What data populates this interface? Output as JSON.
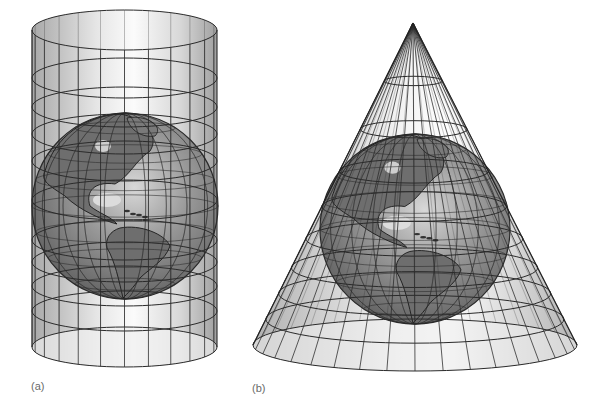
{
  "figure": {
    "panels": [
      {
        "id": "a",
        "label": "(a)",
        "surface": "cylinder",
        "geometry": {
          "left": 32,
          "right": 217,
          "top_cy": 30,
          "bottom_cy": 347,
          "ry": 20
        },
        "parallels_y": [
          30,
          78,
          107,
          134,
          161,
          200,
          240,
          262,
          286,
          311,
          347
        ],
        "meridian_count": 24,
        "globe": {
          "cx": 125,
          "cy": 206,
          "r": 93
        }
      },
      {
        "id": "b",
        "label": "(b)",
        "surface": "cone",
        "geometry": {
          "apex_x": 413,
          "apex_y": 23,
          "base_cx": 415,
          "base_cy": 345,
          "base_rx": 162,
          "base_ry": 26
        },
        "parallel_fractions": [
          0.18,
          0.33,
          0.46,
          0.57,
          0.67,
          0.76,
          0.84,
          0.92,
          1.0
        ],
        "meridian_count": 36,
        "globe": {
          "cx": 415,
          "cy": 229,
          "r": 95
        }
      }
    ],
    "colors": {
      "background": "#ffffff",
      "grid_line": "#2a2a2a",
      "surface_light": "#f4f4f4",
      "surface_dark": "#9c9c9c",
      "ocean": "#8a8a8a",
      "land": "#6e6e6e",
      "label": "#6a6a6a"
    }
  }
}
